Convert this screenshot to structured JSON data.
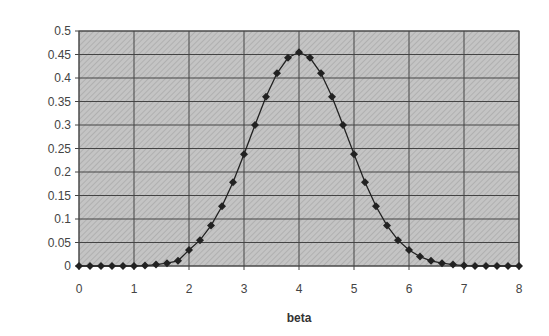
{
  "chart_data": {
    "type": "line",
    "title": "",
    "xlabel": "beta",
    "ylabel": "",
    "xlim": [
      0,
      8
    ],
    "ylim": [
      0,
      0.5
    ],
    "x_ticks": [
      "0",
      "1",
      "2",
      "3",
      "4",
      "5",
      "6",
      "7",
      "8"
    ],
    "y_ticks": [
      "0",
      "0.05",
      "0.1",
      "0.15",
      "0.2",
      "0.25",
      "0.3",
      "0.35",
      "0.4",
      "0.45",
      "0.5"
    ],
    "grid": true,
    "legend": "none",
    "series": [
      {
        "name": "density",
        "marker": "diamond",
        "x": [
          0,
          0.2,
          0.4,
          0.6,
          0.8,
          1,
          1.2,
          1.4,
          1.6,
          1.8,
          2,
          2.2,
          2.4,
          2.6,
          2.8,
          3,
          3.2,
          3.4,
          3.6,
          3.8,
          4,
          4.2,
          4.4,
          4.6,
          4.8,
          5,
          5.2,
          5.4,
          5.6,
          5.8,
          6,
          6.2,
          6.4,
          6.6,
          6.8,
          7,
          7.2,
          7.4,
          7.6,
          7.8,
          8
        ],
        "values": [
          0,
          0,
          0,
          0,
          0,
          0,
          0.001,
          0.003,
          0.006,
          0.011,
          0.034,
          0.055,
          0.086,
          0.127,
          0.178,
          0.238,
          0.3,
          0.36,
          0.41,
          0.443,
          0.455,
          0.443,
          0.41,
          0.36,
          0.3,
          0.238,
          0.178,
          0.127,
          0.086,
          0.055,
          0.034,
          0.02,
          0.011,
          0.006,
          0.003,
          0.001,
          0,
          0,
          0,
          0,
          0
        ]
      }
    ]
  }
}
